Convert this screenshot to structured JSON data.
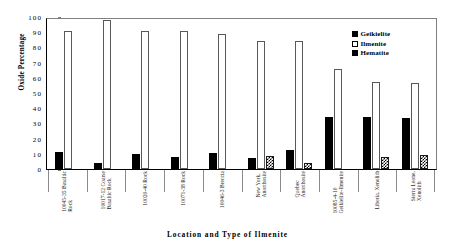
{
  "chart_data": {
    "type": "bar",
    "title": "",
    "xlabel": "Location and Type of Ilmenite",
    "ylabel": "Oxide Percentage",
    "ylim": [
      0,
      100
    ],
    "yticks": [
      0,
      10,
      20,
      30,
      40,
      50,
      60,
      70,
      80,
      90,
      100
    ],
    "grid": false,
    "legend_position": "top-right",
    "categories": [
      "10045-35 Basaltic Rock",
      "10017-12 Coarse Basaltic Rock",
      "10020-40 Rock",
      "10071-38 Rock",
      "10046-3 Breccia",
      "New York, Anorthosite",
      "Quebec Anorthosite",
      "10085-4-10 Geikielite-Ilmenite",
      "Liberia, Xenolith",
      "Sierra Leone, Xenolith"
    ],
    "category_lines": [
      [
        "10045-35 Basaltic",
        "Rock"
      ],
      [
        "10017-12 Coarse",
        "Basaltic Rock"
      ],
      [
        "10020-40 Rock",
        ""
      ],
      [
        "10071-38 Rock",
        ""
      ],
      [
        "10046-3 Breccia",
        ""
      ],
      [
        "New York,",
        "Anorthosite"
      ],
      [
        "Quebec",
        "Anorthosite"
      ],
      [
        "10085-4-10",
        "Geikielite-Ilmenite"
      ],
      [
        "Liberia, Xenolith",
        ""
      ],
      [
        "Sierra Leone,",
        "Xenolith"
      ]
    ],
    "series": [
      {
        "name": "Geikielite",
        "color": "#000000",
        "fill": "solid",
        "values": [
          11.5,
          4.0,
          9.8,
          8.0,
          10.7,
          7.5,
          12.6,
          34.0,
          34.0,
          33.5
        ]
      },
      {
        "name": "Ilmenite",
        "color": "#ffffff",
        "fill": "outline",
        "values": [
          91.0,
          97.8,
          90.5,
          91.0,
          88.5,
          84.0,
          84.0,
          65.5,
          57.5,
          56.5
        ]
      },
      {
        "name": "Hematite",
        "color": "#000000",
        "fill": "hatched",
        "values": [
          null,
          null,
          null,
          null,
          null,
          8.5,
          4.0,
          null,
          7.8,
          9.0
        ]
      }
    ]
  }
}
